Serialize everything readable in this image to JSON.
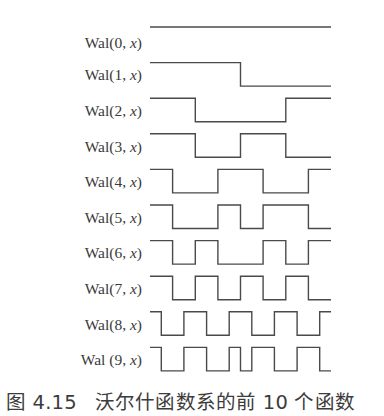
{
  "chart_data": {
    "type": "line",
    "title": "",
    "caption": "图 4.15　沃尔什函数系的前 10 个函数",
    "x_unit": "1/16 of interval [0,1)",
    "series": [
      {
        "name": "Wal(0, x)",
        "label_prefix": "Wal(",
        "index": "0",
        "label_suffix": ")",
        "segments": [
          [
            0,
            16,
            1
          ]
        ]
      },
      {
        "name": "Wal(1, x)",
        "label_prefix": "Wal(",
        "index": "1",
        "label_suffix": ")",
        "segments": [
          [
            0,
            8,
            1
          ],
          [
            8,
            16,
            -1
          ]
        ]
      },
      {
        "name": "Wal(2, x)",
        "label_prefix": "Wal(",
        "index": "2",
        "label_suffix": ")",
        "segments": [
          [
            0,
            4,
            1
          ],
          [
            4,
            12,
            -1
          ],
          [
            12,
            16,
            1
          ]
        ]
      },
      {
        "name": "Wal(3, x)",
        "label_prefix": "Wal(",
        "index": "3",
        "label_suffix": ")",
        "segments": [
          [
            0,
            4,
            1
          ],
          [
            4,
            8,
            -1
          ],
          [
            8,
            12,
            1
          ],
          [
            12,
            16,
            -1
          ]
        ]
      },
      {
        "name": "Wal(4, x)",
        "label_prefix": "Wal(",
        "index": "4",
        "label_suffix": ")",
        "segments": [
          [
            0,
            2,
            1
          ],
          [
            2,
            6,
            -1
          ],
          [
            6,
            10,
            1
          ],
          [
            10,
            14,
            -1
          ],
          [
            14,
            16,
            1
          ]
        ]
      },
      {
        "name": "Wal(5, x)",
        "label_prefix": "Wal(",
        "index": "5",
        "label_suffix": ")",
        "segments": [
          [
            0,
            2,
            1
          ],
          [
            2,
            6,
            -1
          ],
          [
            6,
            8,
            1
          ],
          [
            8,
            10,
            -1
          ],
          [
            10,
            14,
            1
          ],
          [
            14,
            16,
            -1
          ]
        ]
      },
      {
        "name": "Wal(6, x)",
        "label_prefix": "Wal(",
        "index": "6",
        "label_suffix": ")",
        "segments": [
          [
            0,
            2,
            1
          ],
          [
            2,
            4,
            -1
          ],
          [
            4,
            6,
            1
          ],
          [
            6,
            10,
            -1
          ],
          [
            10,
            12,
            1
          ],
          [
            12,
            14,
            -1
          ],
          [
            14,
            16,
            1
          ]
        ]
      },
      {
        "name": "Wal(7, x)",
        "label_prefix": "Wal(",
        "index": "7",
        "label_suffix": ")",
        "segments": [
          [
            0,
            2,
            1
          ],
          [
            2,
            4,
            -1
          ],
          [
            4,
            6,
            1
          ],
          [
            6,
            8,
            -1
          ],
          [
            8,
            10,
            1
          ],
          [
            10,
            12,
            -1
          ],
          [
            12,
            14,
            1
          ],
          [
            14,
            16,
            -1
          ]
        ]
      },
      {
        "name": "Wal(8, x)",
        "label_prefix": "Wal(",
        "index": "8",
        "label_suffix": ")",
        "segments": [
          [
            0,
            1,
            1
          ],
          [
            1,
            3,
            -1
          ],
          [
            3,
            5,
            1
          ],
          [
            5,
            7,
            -1
          ],
          [
            7,
            9,
            1
          ],
          [
            9,
            11,
            -1
          ],
          [
            11,
            13,
            1
          ],
          [
            13,
            15,
            -1
          ],
          [
            15,
            16,
            1
          ]
        ]
      },
      {
        "name": "Wal (9, x)",
        "label_prefix": "Wal (",
        "index": "9",
        "label_suffix": ")",
        "segments": [
          [
            0,
            1,
            1
          ],
          [
            1,
            3,
            -1
          ],
          [
            3,
            5,
            1
          ],
          [
            5,
            7,
            -1
          ],
          [
            7,
            8,
            1
          ],
          [
            8,
            9,
            -1
          ],
          [
            9,
            11,
            1
          ],
          [
            11,
            13,
            -1
          ],
          [
            13,
            15,
            1
          ],
          [
            15,
            16,
            -1
          ]
        ]
      }
    ],
    "grid": false,
    "legend": "none",
    "ylim": [
      -1,
      1
    ]
  },
  "labels": {
    "x_var": "x",
    "separator": ", "
  },
  "caption": {
    "figure_number": "图 4.15",
    "text": "沃尔什函数系的前 10 个函数"
  },
  "style": {
    "line_color": "#4a4a4a",
    "text_color": "#3a3a3a"
  }
}
